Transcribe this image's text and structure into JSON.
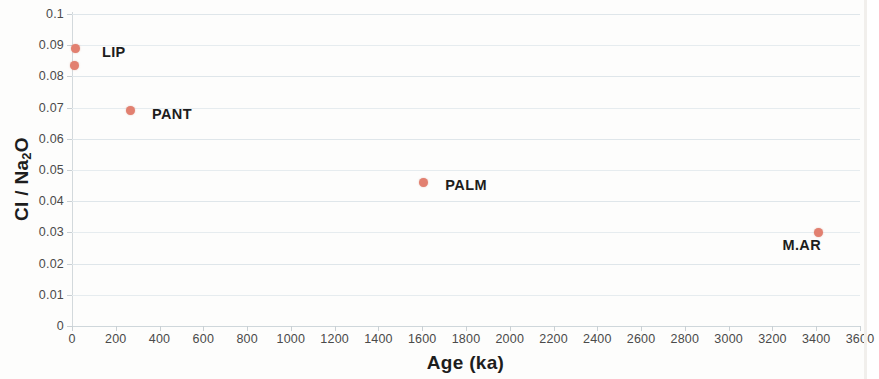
{
  "chart_data": {
    "type": "scatter",
    "title": "",
    "xlabel": "Age (ka)",
    "ylabel": "Cl / Na2O",
    "ylabel_display": "Cl / Na",
    "ylabel_sub": "2",
    "ylabel_tail": "O",
    "xlim": [
      0,
      3600
    ],
    "ylim": [
      0,
      0.1
    ],
    "grid": true,
    "legend": "none",
    "xticks": [
      0,
      200,
      400,
      600,
      800,
      1000,
      1200,
      1400,
      1600,
      1800,
      2000,
      2200,
      2400,
      2600,
      2800,
      3000,
      3200,
      3400,
      3600
    ],
    "xtick_labels": [
      "0",
      "200",
      "400",
      "600",
      "800",
      "1000",
      "1200",
      "1400",
      "1600",
      "1800",
      "2000",
      "2200",
      "2400",
      "2600",
      "2800",
      "3000",
      "3200",
      "3400",
      "3600"
    ],
    "yticks": [
      0,
      0.01,
      0.02,
      0.03,
      0.04,
      0.05,
      0.06,
      0.07,
      0.08,
      0.09,
      0.1
    ],
    "ytick_labels": [
      "0",
      "0.01",
      "0.02",
      "0.03",
      "0.04",
      "0.05",
      "0.06",
      "0.07",
      "0.08",
      "0.09",
      "0.1"
    ],
    "marker_color": "#e28070",
    "gridline_color": "#dfe6ea",
    "points": [
      {
        "label": "LIP",
        "x": 18,
        "y": 0.089,
        "label_dx": 26,
        "label_dy": 4,
        "show_label": true
      },
      {
        "label": "",
        "x": 10,
        "y": 0.0835,
        "label_dx": 0,
        "label_dy": 0,
        "show_label": false
      },
      {
        "label": "PANT",
        "x": 265,
        "y": 0.069,
        "label_dx": 22,
        "label_dy": 3,
        "show_label": true
      },
      {
        "label": "PALM",
        "x": 1605,
        "y": 0.046,
        "label_dx": 22,
        "label_dy": 3,
        "show_label": true
      },
      {
        "label": "M.AR",
        "x": 3410,
        "y": 0.03,
        "label_dx": -36,
        "label_dy": 13,
        "show_label": true
      }
    ]
  }
}
